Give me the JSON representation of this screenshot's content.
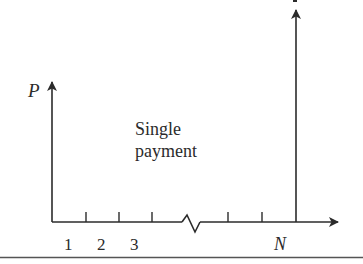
{
  "diagram": {
    "type": "cash-flow-diagram",
    "caption": "Single payment",
    "caption_lines": [
      "Single",
      "payment"
    ],
    "present_value_label": "P",
    "future_value_label_partial": "F",
    "period_labels": [
      "1",
      "2",
      "3",
      "N"
    ],
    "colors": {
      "line": "#2b2b2b",
      "rule": "#555555",
      "background": "#ffffff"
    }
  }
}
